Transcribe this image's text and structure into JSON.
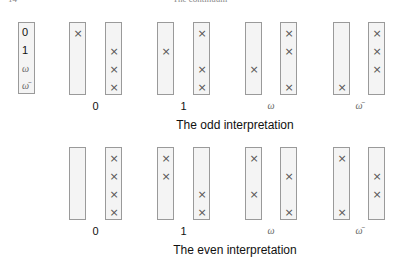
{
  "header": {
    "page": "14",
    "running_title": "The continuum"
  },
  "legend": {
    "items": [
      "0",
      "1",
      "ω",
      "ω̄"
    ]
  },
  "rows": [
    {
      "caption": "The odd interpretation",
      "groups": [
        {
          "label": "0",
          "left": [
            0
          ],
          "right": [
            1,
            2,
            3
          ]
        },
        {
          "label": "1",
          "left": [
            1
          ],
          "right": [
            0,
            2,
            3
          ]
        },
        {
          "label": "ω",
          "left": [
            2
          ],
          "right": [
            0,
            1,
            3
          ]
        },
        {
          "label": "ω̄",
          "left": [
            3
          ],
          "right": [
            0,
            1,
            2
          ]
        }
      ]
    },
    {
      "caption": "The even interpretation",
      "groups": [
        {
          "label": "0",
          "left": [],
          "right": [
            0,
            1,
            2,
            3
          ]
        },
        {
          "label": "1",
          "left": [
            0,
            1
          ],
          "right": [
            2,
            3
          ]
        },
        {
          "label": "ω",
          "left": [
            0,
            2
          ],
          "right": [
            1,
            3
          ]
        },
        {
          "label": "ω̄",
          "left": [
            0,
            3
          ],
          "right": [
            1,
            2
          ]
        }
      ]
    }
  ],
  "mark_symbol": "×"
}
